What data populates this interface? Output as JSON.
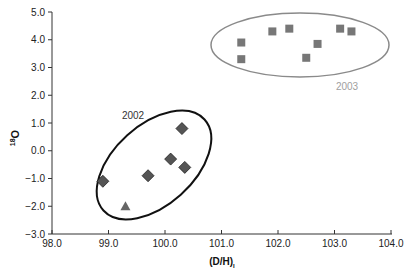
{
  "chart_data": {
    "type": "scatter",
    "title": "",
    "xlabel": "(D/H)",
    "xlabel_subscript": "I",
    "ylabel_sup": "18",
    "ylabel": "O",
    "xlim": [
      98.0,
      104.0
    ],
    "ylim": [
      -3.0,
      5.0
    ],
    "x_ticks": [
      "98.0",
      "99.0",
      "100.0",
      "101.0",
      "102.0",
      "103.0",
      "104.0"
    ],
    "y_ticks": [
      "5.0",
      "4.0",
      "3.0",
      "2.0",
      "1.0",
      "0.0",
      "−1.0",
      "−2.0",
      "−3.0"
    ],
    "grid": false,
    "legend": "none",
    "series": [
      {
        "name": "2002",
        "marker": "diamond",
        "color": "#555555",
        "points": [
          {
            "x": 98.9,
            "y": -1.1
          },
          {
            "x": 99.7,
            "y": -0.9
          },
          {
            "x": 100.1,
            "y": -0.3
          },
          {
            "x": 100.3,
            "y": 0.8
          },
          {
            "x": 100.35,
            "y": -0.6
          }
        ]
      },
      {
        "name": "2002 (triangle)",
        "marker": "triangle",
        "color": "#666666",
        "points": [
          {
            "x": 99.3,
            "y": -2.0
          }
        ]
      },
      {
        "name": "2003",
        "marker": "square",
        "color": "#777777",
        "points": [
          {
            "x": 101.35,
            "y": 3.9
          },
          {
            "x": 101.35,
            "y": 3.3
          },
          {
            "x": 101.9,
            "y": 4.3
          },
          {
            "x": 102.2,
            "y": 4.4
          },
          {
            "x": 102.5,
            "y": 3.35
          },
          {
            "x": 102.7,
            "y": 3.85
          },
          {
            "x": 103.1,
            "y": 4.4
          },
          {
            "x": 103.3,
            "y": 4.3
          }
        ]
      }
    ],
    "annotations": [
      {
        "text": "2002",
        "type": "ellipse-group",
        "color": "#111111"
      },
      {
        "text": "2003",
        "type": "ellipse-group",
        "color": "#999999"
      }
    ]
  }
}
